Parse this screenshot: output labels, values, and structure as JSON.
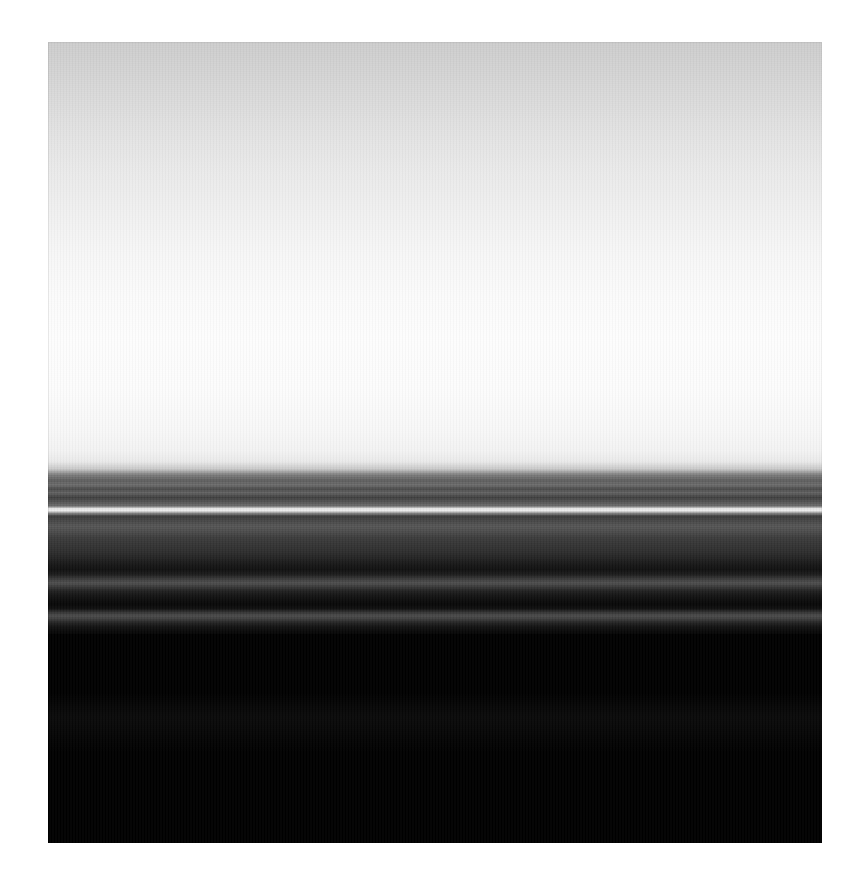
{
  "image": {
    "title": "Horizon with Motion-Blurred Bands",
    "medium": "photograph",
    "orientation": "portrait",
    "plate": {
      "left": 48,
      "top": 42,
      "width": 774,
      "height": 801
    },
    "canvas": {
      "width": 862,
      "height": 895,
      "background": "#ffffff"
    }
  },
  "palette": {
    "mat_white": "#ffffff",
    "sky_top": "#cfcfcf",
    "sky_mid": "#e8e8e8",
    "sky_bright": "#fbfbfb",
    "sky_lower": "#f6f6f6",
    "highlight_line": "#e6e6e6",
    "band_mid_grey": "#5a5a5a",
    "band_dark_grey": "#3a3a3a",
    "band_deep": "#1b1b1b",
    "foreground_black": "#000000",
    "silhouette": "#0a0a0a"
  },
  "regions": [
    {
      "name": "sky",
      "label": "Sky gradient",
      "y_start": 0,
      "y_end": 412,
      "description": "Smooth luminance ramp from light grey at the top edge to near-white just above the horizon"
    },
    {
      "name": "horizon-band",
      "label": "Motion-blurred horizon bands",
      "y_start": 408,
      "y_end": 598,
      "description": "Dense stack of thin horizontal grey bands with one bright near-white streak"
    },
    {
      "name": "foreground",
      "label": "Black foreground",
      "y_start": 592,
      "y_end": 801,
      "description": "Near-black field with barely perceptible silhouette detail"
    }
  ],
  "chart_data": {
    "type": "line",
    "xlabel": "Luminance (0-255)",
    "ylabel": "Row (px from plate top)",
    "xlim": [
      0,
      255
    ],
    "ylim": [
      0,
      801
    ],
    "grid": false,
    "legend": "none",
    "sky_stops": [
      {
        "pos": 0.0,
        "color": "#cdcdcd"
      },
      {
        "pos": 0.08,
        "color": "#d4d4d4"
      },
      {
        "pos": 0.18,
        "color": "#dedede"
      },
      {
        "pos": 0.3,
        "color": "#e9e9e9"
      },
      {
        "pos": 0.42,
        "color": "#f1f1f1"
      },
      {
        "pos": 0.52,
        "color": "#f7f7f7"
      },
      {
        "pos": 0.62,
        "color": "#fbfbfb"
      },
      {
        "pos": 0.72,
        "color": "#fdfdfd"
      },
      {
        "pos": 0.84,
        "color": "#fcfcfc"
      },
      {
        "pos": 0.94,
        "color": "#f8f8f8"
      },
      {
        "pos": 1.0,
        "color": "#f2f2f2"
      }
    ],
    "horizon_stops": [
      {
        "pos": 0.0,
        "color": "#f4f4f4"
      },
      {
        "pos": 0.06,
        "color": "#eaeaea"
      },
      {
        "pos": 0.1,
        "color": "#c8c8c8"
      },
      {
        "pos": 0.13,
        "color": "#7e7e7e"
      },
      {
        "pos": 0.16,
        "color": "#5e5e5e"
      },
      {
        "pos": 0.185,
        "color": "#6c6c6c"
      },
      {
        "pos": 0.205,
        "color": "#4a4a4a"
      },
      {
        "pos": 0.225,
        "color": "#626262"
      },
      {
        "pos": 0.25,
        "color": "#3f3f3f"
      },
      {
        "pos": 0.275,
        "color": "#565656"
      },
      {
        "pos": 0.295,
        "color": "#6d6d6d"
      },
      {
        "pos": 0.308,
        "color": "#e4e4e4"
      },
      {
        "pos": 0.32,
        "color": "#ededed"
      },
      {
        "pos": 0.332,
        "color": "#8a8a8a"
      },
      {
        "pos": 0.348,
        "color": "#3a3a3a"
      },
      {
        "pos": 0.372,
        "color": "#464646"
      },
      {
        "pos": 0.4,
        "color": "#565656"
      },
      {
        "pos": 0.428,
        "color": "#4c4c4c"
      },
      {
        "pos": 0.46,
        "color": "#3c3c3c"
      },
      {
        "pos": 0.5,
        "color": "#343434"
      },
      {
        "pos": 0.54,
        "color": "#2c2c2c"
      },
      {
        "pos": 0.575,
        "color": "#212121"
      },
      {
        "pos": 0.605,
        "color": "#161616"
      },
      {
        "pos": 0.63,
        "color": "#101010"
      },
      {
        "pos": 0.655,
        "color": "#1c1c1c"
      },
      {
        "pos": 0.68,
        "color": "#3b3b3b"
      },
      {
        "pos": 0.7,
        "color": "#4e4e4e"
      },
      {
        "pos": 0.718,
        "color": "#3a3a3a"
      },
      {
        "pos": 0.74,
        "color": "#222222"
      },
      {
        "pos": 0.765,
        "color": "#141414"
      },
      {
        "pos": 0.79,
        "color": "#0c0c0c"
      },
      {
        "pos": 0.812,
        "color": "#070707"
      },
      {
        "pos": 0.835,
        "color": "#0f0f0f"
      },
      {
        "pos": 0.855,
        "color": "#343434"
      },
      {
        "pos": 0.872,
        "color": "#4a4a4a"
      },
      {
        "pos": 0.888,
        "color": "#3e3e3e"
      },
      {
        "pos": 0.908,
        "color": "#242424"
      },
      {
        "pos": 0.93,
        "color": "#121212"
      },
      {
        "pos": 0.955,
        "color": "#080808"
      },
      {
        "pos": 0.978,
        "color": "#030303"
      },
      {
        "pos": 1.0,
        "color": "#000000"
      }
    ],
    "silhouette_stops": [
      {
        "pos": 0.0,
        "color": "#000000"
      },
      {
        "pos": 0.22,
        "color": "#0b0b0b"
      },
      {
        "pos": 0.4,
        "color": "#121212"
      },
      {
        "pos": 0.58,
        "color": "#0d0d0d"
      },
      {
        "pos": 0.78,
        "color": "#060606"
      },
      {
        "pos": 1.0,
        "color": "#000000"
      }
    ],
    "key_features": [
      {
        "name": "bright-streak",
        "y": 425,
        "luminance": 237,
        "note": "Single bright near-white horizontal streak within the dark band"
      },
      {
        "name": "sky-peak",
        "y": 290,
        "luminance": 253,
        "note": "Brightest point of the sky gradient"
      },
      {
        "name": "top-edge",
        "y": 0,
        "luminance": 205,
        "note": "Darkest point of the sky gradient at the top edge"
      },
      {
        "name": "grey-streak-lower",
        "y": 545,
        "luminance": 78,
        "note": "Broad soft grey streak low in the band stack"
      },
      {
        "name": "black-floor",
        "y": 700,
        "luminance": 2,
        "note": "Deep black foreground floor"
      }
    ]
  }
}
